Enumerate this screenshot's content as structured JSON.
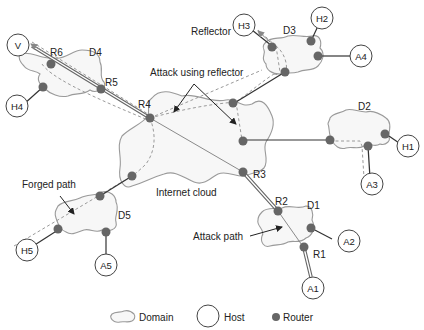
{
  "diagram": {
    "labels": {
      "reflector": "Reflector",
      "attack_using_reflector": "Attack using reflector",
      "internet_cloud": "Internet cloud",
      "forged_path": "Forged path",
      "attack_path": "Attack path"
    },
    "domains": {
      "d1": "D1",
      "d2": "D2",
      "d3": "D3",
      "d4": "D4",
      "d5": "D5"
    },
    "routers": {
      "r1": "R1",
      "r2": "R2",
      "r3": "R3",
      "r4": "R4",
      "r5": "R5",
      "r6": "R6"
    },
    "hosts": {
      "v": "V",
      "h1": "H1",
      "h2": "H2",
      "h3": "H3",
      "h4": "H4",
      "h5": "H5",
      "a1": "A1",
      "a2": "A2",
      "a3": "A3",
      "a4": "A4",
      "a5": "A5"
    },
    "legend": {
      "domain": "Domain",
      "host": "Host",
      "router": "Router"
    },
    "colors": {
      "router": "#666666",
      "cloud_stroke": "#9a9a9a",
      "link": "#333333"
    }
  }
}
